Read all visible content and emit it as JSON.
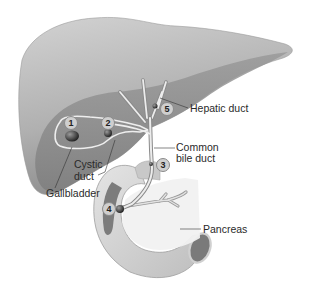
{
  "diagram": {
    "colors": {
      "liver_light": "#c4c4c4",
      "liver_dark": "#8f8f8f",
      "duct": "#e6e6e6",
      "duodenum": "#d6d6d6",
      "duodenum_inner": "#7c7c7c",
      "pancreas": "#f0f0f0",
      "stone": "#3a3a3a",
      "text": "#2a2a2a"
    },
    "labels": {
      "hepatic_duct": "Hepatic duct",
      "common_bile_duct_line1": "Common",
      "common_bile_duct_line2": "bile duct",
      "cystic_duct_line1": "Cystic",
      "cystic_duct_line2": "duct",
      "gallbladder": "Gallbladder",
      "pancreas": "Pancreas"
    },
    "markers": [
      {
        "id": "1",
        "label": "1",
        "location": "gallbladder body stone"
      },
      {
        "id": "2",
        "label": "2",
        "location": "gallbladder neck / cystic duct stone"
      },
      {
        "id": "3",
        "label": "3",
        "location": "common bile duct stone"
      },
      {
        "id": "4",
        "label": "4",
        "location": "ampulla of Vater stone"
      },
      {
        "id": "5",
        "label": "5",
        "location": "hepatic duct stone"
      }
    ]
  }
}
